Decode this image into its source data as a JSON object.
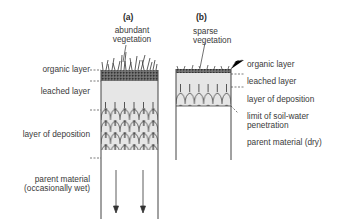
{
  "profile_a": {
    "heading": "(a)",
    "vegetation": [
      "abundant",
      "vegetation"
    ],
    "layers": {
      "organic": "organic layer",
      "leached": "leached layer",
      "deposition": "layer of deposition",
      "parent": [
        "parent material",
        "(occasionally wet)"
      ]
    }
  },
  "profile_b": {
    "heading": "(b)",
    "vegetation": [
      "sparse",
      "vegetation"
    ],
    "layers": {
      "organic": "organic layer",
      "leached": "leached layer",
      "deposition": "layer of deposition",
      "limit": [
        "limit of soil-water",
        "penetration"
      ],
      "parent": "parent material (dry)"
    }
  },
  "colors": {
    "leached_fill": "#e6e6e6",
    "organic_fill": "#555555",
    "line": "#444444"
  }
}
